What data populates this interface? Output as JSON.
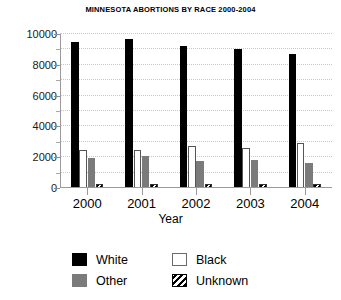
{
  "chart_data": {
    "type": "bar",
    "title": "MINNESOTA ABORTIONS BY RACE 2000-2004",
    "xlabel": "Year",
    "ylabel": "",
    "categories": [
      "2000",
      "2001",
      "2002",
      "2003",
      "2004"
    ],
    "series": [
      {
        "name": "White",
        "color": "#000000",
        "values": [
          9500,
          9700,
          9200,
          9000,
          8700
        ]
      },
      {
        "name": "Black",
        "color": "#ffffff",
        "values": [
          2450,
          2500,
          2700,
          2600,
          2900
        ]
      },
      {
        "name": "Other",
        "color": "#7b7b7b",
        "values": [
          1950,
          2050,
          1750,
          1800,
          1600
        ]
      },
      {
        "name": "Unknown",
        "color": "#ffffff",
        "values": [
          260,
          250,
          240,
          230,
          230
        ]
      }
    ],
    "ylim": [
      0,
      10000
    ],
    "ytick_values": [
      0,
      2000,
      4000,
      6000,
      8000,
      10000
    ],
    "ytick_labels": [
      "0",
      "2000",
      "4000",
      "6000",
      "8000",
      "10000"
    ],
    "yminor_values": [
      1000,
      3000,
      5000,
      7000,
      9000
    ],
    "grid": true,
    "legend_position": "bottom",
    "legend_entries": [
      {
        "label": "White",
        "swatch": "solid-black"
      },
      {
        "label": "Black",
        "swatch": "outline-white"
      },
      {
        "label": "Other",
        "swatch": "solid-gray"
      },
      {
        "label": "Unknown",
        "swatch": "diagonal-hatch"
      }
    ]
  }
}
